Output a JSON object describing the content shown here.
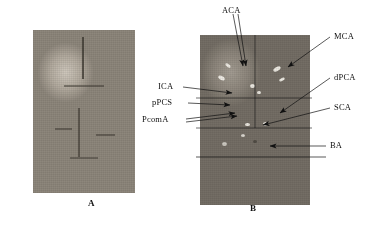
{
  "figure": {
    "background": "#ffffff",
    "panels": [
      {
        "id": "A",
        "caption": "A",
        "description": "gross ventral view photograph of brain specimen",
        "labels": []
      },
      {
        "id": "B",
        "caption": "B",
        "description": "ventral view photograph of brain with cerebral arteries labeled",
        "labels": [
          "ACA",
          "MCA",
          "dPCA",
          "SCA",
          "BA",
          "ICA",
          "pPCS",
          "PcomA"
        ]
      }
    ],
    "annotations": {
      "aca": "ACA",
      "mca": "MCA",
      "dpca": "dPCA",
      "sca": "SCA",
      "ba": "BA",
      "ica": "ICA",
      "ppcs": "pPCS",
      "pcoma": "PcomA"
    },
    "captions": {
      "panel_a": "A",
      "panel_b": "B"
    },
    "colors": {
      "line": "#111111",
      "text": "#111111",
      "background": "#ffffff"
    }
  }
}
